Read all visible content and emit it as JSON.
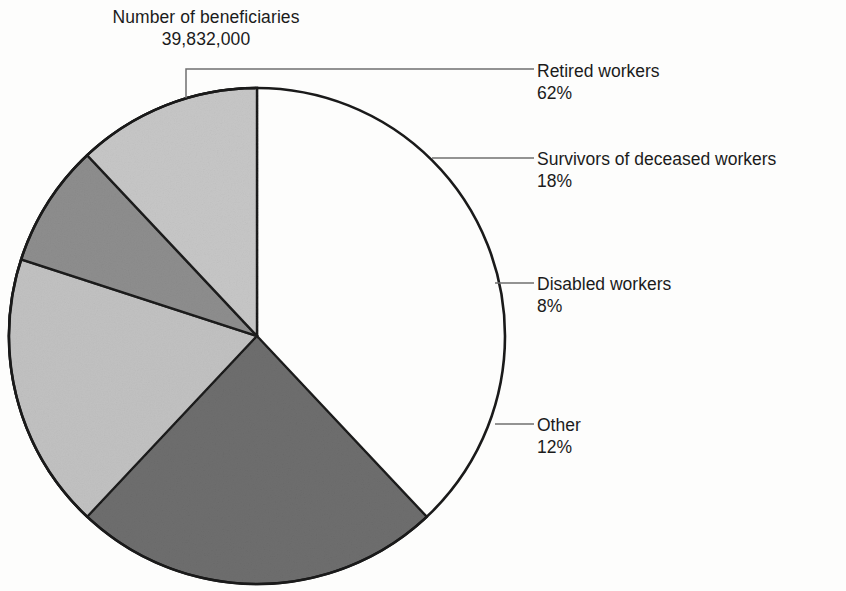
{
  "chart_data": {
    "type": "pie",
    "title": "Number of beneficiaries",
    "subtitle": "39,832,000",
    "total_label": "39,832,000",
    "total_value": 39832000,
    "categories": [
      "Retired workers",
      "Survivors of deceased workers",
      "Disabled workers",
      "Other"
    ],
    "values": [
      62,
      18,
      8,
      12
    ],
    "value_labels": [
      "62%",
      "18%",
      "8%",
      "12%"
    ],
    "units": "percent",
    "legend": "callout labels with leader lines, right side",
    "grid": false,
    "slices": [
      {
        "name": "Retired workers",
        "percent": 62,
        "percent_label": "62%",
        "color": "#6e6e6e",
        "start_deg": 138.0,
        "end_deg": 360.0
      },
      {
        "name": "Survivors of deceased workers",
        "percent": 18,
        "percent_label": "18%",
        "color": "#c2c2c2",
        "start_deg": 0.0,
        "end_deg": 64.8
      },
      {
        "name": "Disabled workers",
        "percent": 8,
        "percent_label": "8%",
        "color": "#8e8e8e",
        "start_deg": 64.8,
        "end_deg": 93.6
      },
      {
        "name": "Other",
        "percent": 12,
        "percent_label": "12%",
        "color": "#c7c7c7",
        "start_deg": 93.6,
        "end_deg": 138.0
      }
    ]
  },
  "header": {
    "title": "Number of beneficiaries",
    "total": "39,832,000"
  },
  "callouts": {
    "retired": {
      "label": "Retired workers",
      "value": "62%"
    },
    "survivors": {
      "label": "Survivors of deceased workers",
      "value": "18%"
    },
    "disabled": {
      "label": "Disabled workers",
      "value": "8%"
    },
    "other": {
      "label": "Other",
      "value": "12%"
    }
  },
  "colors": {
    "retired": "#6e6e6e",
    "survivors": "#c2c2c2",
    "disabled": "#8e8e8e",
    "other": "#c7c7c7",
    "outline": "#1a1a1a",
    "leader": "#6f6f6f",
    "text": "#1b1b1b",
    "background": "#fdfdfc"
  }
}
